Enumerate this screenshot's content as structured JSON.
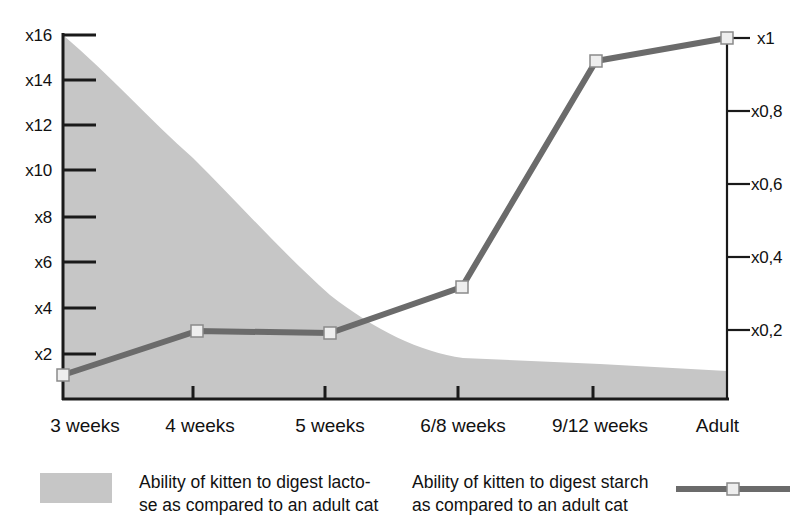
{
  "chart_data": {
    "type": "area",
    "title": "",
    "xlabel": "",
    "categories": [
      "3 weeks",
      "4 weeks",
      "5 weeks",
      "6/8 weeks",
      "9/12 weeks",
      "Adult"
    ],
    "grid": false,
    "legend_position": "bottom",
    "series": [
      {
        "name": "Ability of kitten to digest lacto-\nse as compared to an adult cat",
        "type": "area",
        "axis": "left",
        "color": "#c6c6c6",
        "ylabel": "",
        "values": [
          16.0,
          11.2,
          5.0,
          2.0,
          1.8,
          1.5
        ]
      },
      {
        "name": "Ability of kitten to digest starch\nas compared to an adult cat",
        "type": "line",
        "axis": "right",
        "color": "#6b6b6b",
        "marker": "square",
        "ylabel": "",
        "values": [
          0.07,
          0.21,
          0.21,
          0.36,
          0.93,
          1.0
        ]
      }
    ],
    "y_left": {
      "ticks": [
        "x2",
        "x4",
        "x6",
        "x8",
        "x10",
        "x12",
        "x14",
        "x16"
      ],
      "tick_values": [
        2,
        4,
        6,
        8,
        10,
        12,
        14,
        16
      ],
      "ylim": [
        0,
        16
      ]
    },
    "y_right": {
      "ticks": [
        "x0,2",
        "x0,4",
        "x0,6",
        "x0,8",
        "x1"
      ],
      "tick_values": [
        0.2,
        0.4,
        0.6,
        0.8,
        1.0
      ],
      "ylim": [
        0,
        1.0
      ]
    }
  },
  "axes": {
    "left_ticks": [
      {
        "label": "x16",
        "y": 35
      },
      {
        "label": "x14",
        "y": 80
      },
      {
        "label": "x12",
        "y": 125
      },
      {
        "label": "x10",
        "y": 170
      },
      {
        "label": "x8",
        "y": 217
      },
      {
        "label": "x6",
        "y": 262
      },
      {
        "label": "x4",
        "y": 308
      },
      {
        "label": "x2",
        "y": 354
      }
    ],
    "right_ticks": [
      {
        "label": "x1",
        "y": 38
      },
      {
        "label": "x0,8",
        "y": 111
      },
      {
        "label": "x0,6",
        "y": 184
      },
      {
        "label": "x0,4",
        "y": 257
      },
      {
        "label": "x0,2",
        "y": 330
      }
    ],
    "x_categories": [
      {
        "label": "3 weeks",
        "x": 85
      },
      {
        "label": "4 weeks",
        "x": 200
      },
      {
        "label": "5 weeks",
        "x": 330
      },
      {
        "label": "6/8 weeks",
        "x": 463
      },
      {
        "label": "9/12 weeks",
        "x": 600
      },
      {
        "label": "Adult",
        "x": 718
      }
    ]
  },
  "legend": {
    "lactose": {
      "label": "Ability of kitten to digest lacto-\nse as compared to an adult cat",
      "color": "#c6c6c6"
    },
    "starch": {
      "label": "Ability of kitten to digest starch\nas compared to an adult cat",
      "color": "#6b6b6b"
    }
  },
  "colors": {
    "area_fill": "#c6c6c6",
    "line": "#6b6b6b",
    "axis": "#1a1a1a",
    "marker_face": "#eeeeee",
    "background": "#ffffff"
  }
}
